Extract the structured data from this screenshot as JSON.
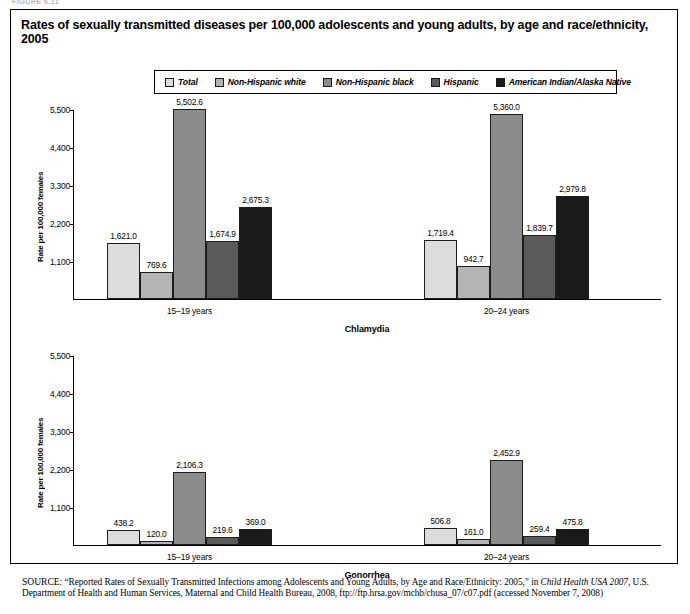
{
  "figure_caption_cut": "FIGURE 6.11",
  "title": "Rates of sexually transmitted diseases per 100,000 adolescents and young adults, by age and race/ethnicity, 2005",
  "legend": {
    "items": [
      {
        "label": "Total",
        "color": "#dcdcdc"
      },
      {
        "label": "Non-Hispanic white",
        "color": "#b4b4b4"
      },
      {
        "label": "Non-Hispanic black",
        "color": "#8c8c8c"
      },
      {
        "label": "Hispanic",
        "color": "#5a5a5a"
      },
      {
        "label": "American Indian/Alaska Native",
        "color": "#1a1a1a"
      }
    ]
  },
  "axis": {
    "ylabel": "Rate per 100,000 females",
    "yticks": [
      "1,100",
      "2,200",
      "3,300",
      "4,400",
      "5,500"
    ]
  },
  "panels": [
    {
      "name": "Chlamydia",
      "groups": [
        {
          "label": "15–19 years",
          "values": [
            "1,621.0",
            "769.6",
            "5,502.6",
            "1,674.9",
            "2,675.3"
          ]
        },
        {
          "label": "20–24 years",
          "values": [
            "1,719.4",
            "942.7",
            "5,360.0",
            "1,839.7",
            "2,979.8"
          ]
        }
      ]
    },
    {
      "name": "Gonorrhea",
      "groups": [
        {
          "label": "15–19 years",
          "values": [
            "438.2",
            "120.0",
            "2,106.3",
            "219.6",
            "369.0"
          ]
        },
        {
          "label": "20–24 years",
          "values": [
            "506.8",
            "161.0",
            "2,452.9",
            "259.4",
            "475.8"
          ]
        }
      ]
    }
  ],
  "source": {
    "prefix": "SOURCE:",
    "line": " “Reported Rates of Sexually Transmitted Infections among Adolescents and Young Adults, by Age and Race/Ethnicity: 2005,” in ",
    "italic1": "Child Health USA 2007",
    "line2": ", U.S. Department of Health and Human Services, Maternal and Child Health Bureau, 2008, ftp://ftp.hrsa.gov/mchb/chusa_07/c07.pdf (accessed",
    "line3": "November 7, 2008)"
  },
  "chart_data": {
    "type": "bar",
    "title": "Rates of sexually transmitted diseases per 100,000 adolescents and young adults, by age and race/ethnicity, 2005",
    "ylabel": "Rate per 100,000 females",
    "xlabel": "",
    "ylim": [
      0,
      5500
    ],
    "yticks": [
      1100,
      2200,
      3300,
      4400,
      5500
    ],
    "grid": false,
    "legend_position": "top",
    "legend": [
      "Total",
      "Non-Hispanic white",
      "Non-Hispanic black",
      "Hispanic",
      "American Indian/Alaska Native"
    ],
    "panels": [
      {
        "title": "Chlamydia",
        "categories": [
          "15–19 years",
          "20–24 years"
        ],
        "series": [
          {
            "name": "Total",
            "values": [
              1621.0,
              1719.4
            ]
          },
          {
            "name": "Non-Hispanic white",
            "values": [
              769.6,
              942.7
            ]
          },
          {
            "name": "Non-Hispanic black",
            "values": [
              5502.6,
              5360.0
            ]
          },
          {
            "name": "Hispanic",
            "values": [
              1674.9,
              1839.7
            ]
          },
          {
            "name": "American Indian/Alaska Native",
            "values": [
              2675.3,
              2979.8
            ]
          }
        ]
      },
      {
        "title": "Gonorrhea",
        "categories": [
          "15–19 years",
          "20–24 years"
        ],
        "series": [
          {
            "name": "Total",
            "values": [
              438.2,
              506.8
            ]
          },
          {
            "name": "Non-Hispanic white",
            "values": [
              120.0,
              161.0
            ]
          },
          {
            "name": "Non-Hispanic black",
            "values": [
              2106.3,
              2452.9
            ]
          },
          {
            "name": "Hispanic",
            "values": [
              219.6,
              259.4
            ]
          },
          {
            "name": "American Indian/Alaska Native",
            "values": [
              475.8,
              475.8
            ]
          }
        ]
      }
    ]
  }
}
